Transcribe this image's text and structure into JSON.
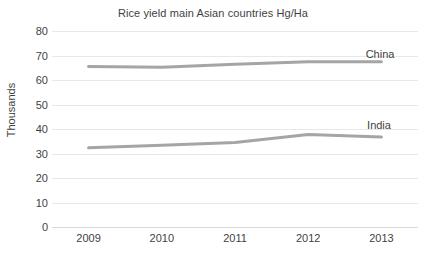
{
  "chart_data": {
    "type": "line",
    "title": "Rice yield main Asian countries Hg/Ha",
    "xlabel": "",
    "ylabel": "Thousands",
    "categories": [
      "2009",
      "2010",
      "2011",
      "2012",
      "2013"
    ],
    "x": [
      2009,
      2010,
      2011,
      2012,
      2013
    ],
    "series": [
      {
        "name": "China",
        "values": [
          65.5,
          65.2,
          66.4,
          67.4,
          67.4
        ],
        "color": "#a5a5a5"
      },
      {
        "name": "India",
        "values": [
          32.3,
          33.4,
          34.5,
          37.8,
          36.7
        ],
        "color": "#a5a5a5"
      }
    ],
    "ylim": [
      0,
      80
    ],
    "y_ticks": [
      0,
      10,
      20,
      30,
      40,
      50,
      60,
      70,
      80
    ],
    "y_tick_labels": [
      "0",
      "10",
      "20",
      "30",
      "40",
      "50",
      "60",
      "70",
      "80"
    ],
    "grid": true,
    "grid_axis": "y",
    "legend": "inline-series-labels",
    "legend_position": "right-inside",
    "annotations": [
      {
        "text": "China",
        "series": "China",
        "x_px": 380,
        "y_px": 48
      },
      {
        "text": "India",
        "series": "India",
        "x_px": 379,
        "y_px": 119
      }
    ]
  },
  "style": {
    "background": "#ffffff",
    "text_color": "#3f3f3f",
    "gridline_color": "#e8e8e8",
    "baseline_color": "#d9d9d9",
    "line_color": "#a5a5a5",
    "line_width": 3
  }
}
